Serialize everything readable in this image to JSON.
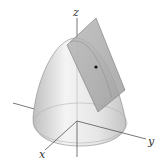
{
  "figure": {
    "axes": {
      "x_label": "x",
      "y_label": "y",
      "z_label": "z"
    },
    "colors": {
      "surface_light": "#f2f2f2",
      "surface_dark": "#bdbdbd",
      "plane_fill": "#a9a9a9",
      "axis": "#555555",
      "point": "#111111"
    }
  }
}
